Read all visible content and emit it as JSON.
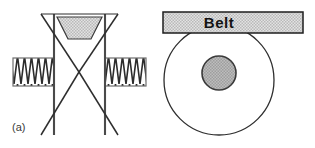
{
  "figure": {
    "label": "(a)",
    "caption_label": "(a)",
    "background_color": "#ffffff",
    "line_color": "#3a3a3a",
    "dark_line_color": "#1e1e1e",
    "hatch_fill_color": "#c8c8c8",
    "shade_fill_color": "#cfcfcf",
    "hub_fill_color": "#b0b0b0"
  },
  "left_view": {
    "name": "v-groove-pulley-cross-section",
    "description_parts": {
      "left_shaft": "left-shaft-hatched",
      "right_shaft": "right-shaft-hatched",
      "groove": "v-groove",
      "belt_section": "belt-cross-section-trapezoid",
      "rim_left": "rim-left-edge",
      "rim_right": "rim-right-edge"
    },
    "geometry": {
      "rim_left_x": 54,
      "rim_right_x": 105,
      "rim_top_y": 14,
      "rim_bottom_y": 135,
      "apex_x": 79,
      "apex_y": 72,
      "outer_top_left_x": 41,
      "outer_top_right_x": 118,
      "outer_bottom_left_x": 41,
      "outer_bottom_right_x": 118,
      "shaft_left": {
        "x": 13,
        "y": 58,
        "w": 41,
        "h": 28
      },
      "shaft_right": {
        "x": 105,
        "y": 58,
        "w": 41,
        "h": 28
      },
      "belt_trapezoid": {
        "top_left_x": 57,
        "top_right_x": 102,
        "top_y": 17,
        "bottom_left_x": 68,
        "bottom_right_x": 91,
        "bottom_y": 39
      }
    }
  },
  "right_view": {
    "name": "pulley-front-view",
    "belt_label": "Belt",
    "geometry": {
      "pulley_center_x": 219,
      "pulley_center_y": 80,
      "pulley_radius": 55,
      "hub_center_x": 219,
      "hub_center_y": 73,
      "hub_radius": 17,
      "belt_rect": {
        "x": 163,
        "y": 12,
        "w": 140,
        "h": 21
      },
      "belt_text_x": 219,
      "belt_text_y": 28
    }
  }
}
